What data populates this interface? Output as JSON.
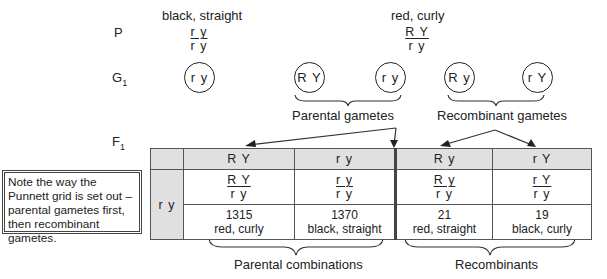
{
  "generations": {
    "p_label": "P",
    "g1_label": "G",
    "g1_sub": "1",
    "f1_label": "F",
    "f1_sub": "1"
  },
  "parents": [
    {
      "phenotype": "black, straight",
      "genotype_top": "r y",
      "genotype_bottom": "r y"
    },
    {
      "phenotype": "red, curly",
      "genotype_top": "R Y",
      "genotype_bottom": "r y"
    }
  ],
  "gametes": [
    {
      "label": "r y"
    },
    {
      "label": "R Y"
    },
    {
      "label": "r y"
    },
    {
      "label": "R y"
    },
    {
      "label": "r Y"
    }
  ],
  "brace_labels": {
    "parental_gametes": "Parental gametes",
    "recombinant_gametes": "Recombinant gametes",
    "parental_combinations": "Parental combinations",
    "recombinants": "Recombinants"
  },
  "note": "Note the way the Punnett grid is set out – parental gametes first, then recombinant gametes.",
  "punnett": {
    "row_gamete": "r y",
    "columns": [
      {
        "gamete": "R Y",
        "genotype_top": "R Y",
        "genotype_bottom": "r y",
        "count": "1315",
        "phenotype": "red, curly"
      },
      {
        "gamete": "r y",
        "genotype_top": "r y",
        "genotype_bottom": "r y",
        "count": "1370",
        "phenotype": "black, straight"
      },
      {
        "gamete": "R y",
        "genotype_top": "R y",
        "genotype_bottom": "r y",
        "count": "21",
        "phenotype": "red, straight"
      },
      {
        "gamete": "r Y",
        "genotype_top": "r Y",
        "genotype_bottom": "r y",
        "count": "19",
        "phenotype": "black, curly"
      }
    ]
  }
}
